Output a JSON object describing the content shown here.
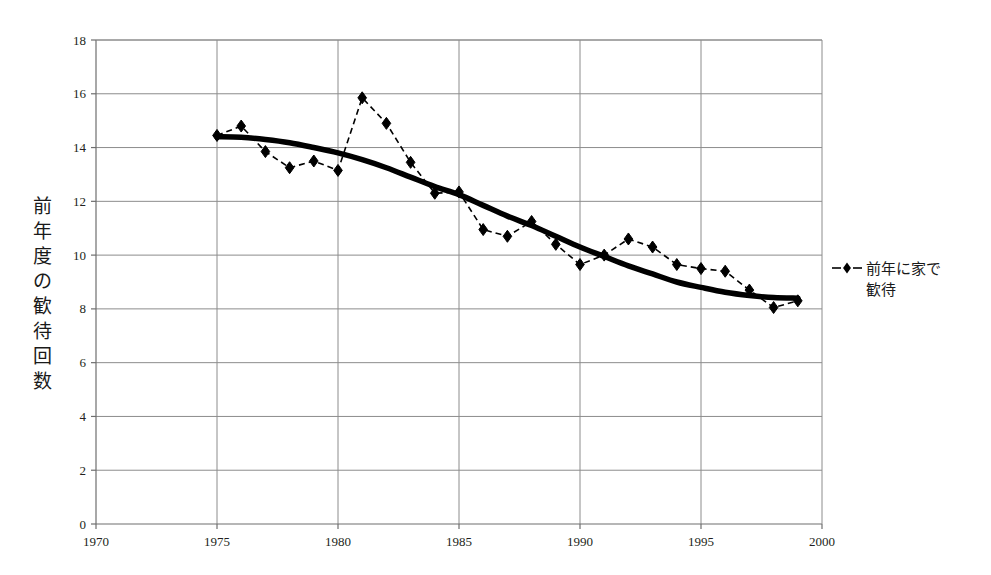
{
  "chart_data": {
    "type": "line",
    "title": "",
    "subtitle": "",
    "xlabel": "",
    "ylabel": "前年度の歓待回数",
    "ylabel_chars": [
      "前",
      "年",
      "度",
      "の",
      "歓",
      "待",
      "回",
      "数"
    ],
    "xlim": [
      1970,
      2000
    ],
    "ylim": [
      0,
      18
    ],
    "xticks": [
      1970,
      1975,
      1980,
      1985,
      1990,
      1995,
      2000
    ],
    "xtick_labels": [
      "1970",
      "1975",
      "1980",
      "1985",
      "1990",
      "1995",
      "2000"
    ],
    "yticks": [
      0,
      2,
      4,
      6,
      8,
      10,
      12,
      14,
      16,
      18
    ],
    "ytick_labels": [
      "0",
      "2",
      "4",
      "6",
      "8",
      "10",
      "12",
      "14",
      "16",
      "18"
    ],
    "grid": true,
    "grid_x": true,
    "grid_y": true,
    "legend_position": "right",
    "x": [
      1975,
      1976,
      1977,
      1978,
      1979,
      1980,
      1981,
      1982,
      1983,
      1984,
      1985,
      1986,
      1987,
      1988,
      1989,
      1990,
      1991,
      1992,
      1993,
      1994,
      1995,
      1996,
      1997,
      1998,
      1999
    ],
    "series": [
      {
        "name": "前年に家で歓待",
        "marker": "diamond",
        "linestyle": "dashed",
        "color": "#000000",
        "values": [
          14.45,
          14.8,
          13.85,
          13.25,
          13.5,
          13.15,
          15.85,
          14.9,
          13.45,
          12.3,
          12.35,
          10.95,
          10.7,
          11.25,
          10.4,
          9.65,
          10.0,
          10.6,
          10.3,
          9.65,
          9.5,
          9.4,
          8.7,
          8.05,
          8.3
        ]
      },
      {
        "name": "trend",
        "marker": "none",
        "linestyle": "solid-thick",
        "color": "#000000",
        "values": [
          14.4,
          14.38,
          14.3,
          14.18,
          14.0,
          13.8,
          13.55,
          13.25,
          12.9,
          12.55,
          12.25,
          11.85,
          11.45,
          11.1,
          10.7,
          10.3,
          9.95,
          9.6,
          9.3,
          9.0,
          8.8,
          8.62,
          8.5,
          8.42,
          8.4
        ]
      }
    ],
    "legend": [
      {
        "label_line1": "前年に家で",
        "label_line2": "歓待",
        "marker": "diamond",
        "linestyle": "dashed"
      }
    ]
  },
  "colors": {
    "grid": "#8c8c8c",
    "axis": "#6e6e6e",
    "data": "#000000",
    "text": "#231f20",
    "background": "#ffffff"
  }
}
